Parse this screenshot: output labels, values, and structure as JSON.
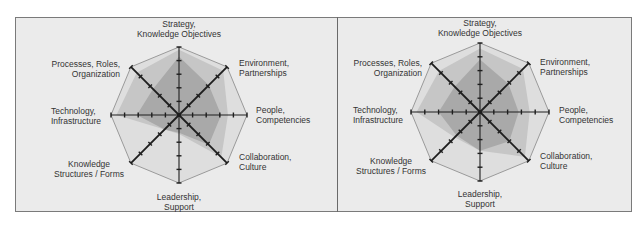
{
  "chart_data": [
    {
      "type": "radar",
      "title": "",
      "axes": [
        [
          "Strategy,",
          "Knowledge Objectives"
        ],
        [
          "Environment,",
          "Partnerships"
        ],
        [
          "People,",
          "Competencies"
        ],
        [
          "Collaboration,",
          "Culture"
        ],
        [
          "Leadership,",
          "Support"
        ],
        [
          "Knowledge",
          "Structures / Forms"
        ],
        [
          "Technology,",
          "Infrastructure"
        ],
        [
          "Processes, Roles,",
          "Organization"
        ]
      ],
      "scale": {
        "min": 0,
        "max": 5,
        "ticks": 5
      },
      "grid": "octagon outline",
      "legend": "none",
      "series": [
        {
          "name": "series-light",
          "color": "#c6c6c6",
          "values": [
            4.8,
            4.6,
            3.6,
            4.4,
            1.4,
            1.5,
            4.6,
            4.4
          ]
        },
        {
          "name": "series-dark",
          "color": "#a9a9a9",
          "values": [
            4.3,
            3.1,
            3.1,
            3.1,
            1.3,
            1.5,
            3.1,
            2.7
          ]
        }
      ]
    },
    {
      "type": "radar",
      "title": "",
      "axes": [
        [
          "Strategy,",
          "Knowledge Objectives"
        ],
        [
          "Environment,",
          "Partnerships"
        ],
        [
          "People,",
          "Competencies"
        ],
        [
          "Collaboration,",
          "Culture"
        ],
        [
          "Leadership,",
          "Support"
        ],
        [
          "Knowledge",
          "Structures / Forms"
        ],
        [
          "Technology,",
          "Infrastructure"
        ],
        [
          "Processes, Roles,",
          "Organization"
        ]
      ],
      "scale": {
        "min": 0,
        "max": 5,
        "ticks": 5
      },
      "grid": "octagon outline",
      "legend": "none",
      "series": [
        {
          "name": "series-light",
          "color": "#c6c6c6",
          "values": [
            4.6,
            4.4,
            3.6,
            4.6,
            2.8,
            2.6,
            4.6,
            4.2
          ]
        },
        {
          "name": "series-dark",
          "color": "#a9a9a9",
          "values": [
            3.8,
            2.9,
            2.8,
            3.0,
            2.8,
            2.4,
            3.0,
            2.6
          ]
        }
      ]
    }
  ],
  "colors": {
    "panel_bg": "#ebebeb",
    "octagon_fill": "#dedede",
    "octagon_stroke": "#9a9a9a",
    "axis": "#1e1e1e"
  }
}
